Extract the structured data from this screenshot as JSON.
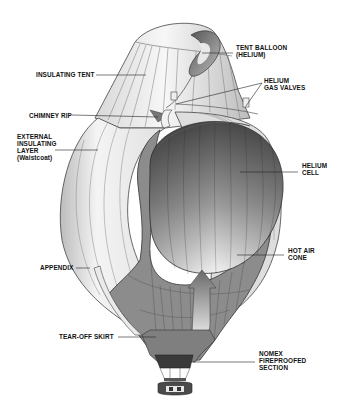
{
  "diagram": {
    "labels": {
      "tent_balloon": [
        "TENT BALLOON",
        "(HELIUM)"
      ],
      "insulating_tent": "INSULATING TENT",
      "helium_gas_valves": [
        "HELIUM",
        "GAS VALVES"
      ],
      "chimney_rip": "CHIMNEY RIP",
      "external_insulating_layer": [
        "EXTERNAL",
        "INSULATING",
        "LAYER",
        "(Waistcoat)"
      ],
      "helium_cell": [
        "HELIUM",
        "CELL"
      ],
      "hot_air_cone": [
        "HOT AIR",
        "CONE"
      ],
      "appendix": "APPENDIX",
      "tear_off_skirt": "TEAR-OFF SKIRT",
      "nomex_section": [
        "NOMEX",
        "FIREPROOFED",
        "SECTION"
      ]
    },
    "colors": {
      "background": "#ffffff",
      "outline": "#333333",
      "light_fabric": "#eeeeee",
      "mid_fabric": "#9a9a9a",
      "dark_fabric": "#6e6e6e",
      "nomex": "#3a3a3a",
      "leader": "#222222"
    }
  }
}
